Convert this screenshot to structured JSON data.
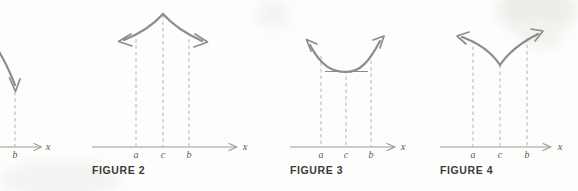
{
  "page": {
    "width": 578,
    "height": 191,
    "background_color": "#fdfdfc"
  },
  "style": {
    "curve_color": "#8c8c8c",
    "axis_color": "#9a9a9a",
    "dash_color": "#b5b5b5",
    "caption_color": "#3a3a3a",
    "label_color": "#5a5a5a"
  },
  "figures": [
    {
      "id": "figure-1-partial",
      "caption": "",
      "clipped": true,
      "axis_label": "x",
      "tick_labels": [
        "b"
      ],
      "curve_type": "decreasing-arrow",
      "description": "Partially visible figure cut off at left edge; a curve descends to the right ending in a downward arrow above the point b on the x-axis"
    },
    {
      "id": "figure-2",
      "caption": "FIGURE 2",
      "clipped": false,
      "axis_label": "x",
      "tick_labels": [
        "a",
        "c",
        "b"
      ],
      "curve_type": "cusp-maximum",
      "description": "Curve rises to a sharp cusp maximum at c, with arrows pointing outward and downward to the left past a and to the right past b"
    },
    {
      "id": "figure-3",
      "caption": "FIGURE 3",
      "clipped": false,
      "axis_label": "x",
      "tick_labels": [
        "a",
        "c",
        "b"
      ],
      "curve_type": "smooth-minimum",
      "has_tangent_line": true,
      "description": "Smooth U-shaped curve with a minimum at c; a horizontal tangent line is drawn at the minimum; arrows point up-left past a and up-right past b"
    },
    {
      "id": "figure-4",
      "caption": "FIGURE 4",
      "clipped": false,
      "axis_label": "x",
      "tick_labels": [
        "a",
        "c",
        "b"
      ],
      "curve_type": "cusp-minimum",
      "description": "Curve descends to a sharp V-shaped cusp minimum at c, then rises; arrows point up-left past a and up-right past b"
    }
  ]
}
